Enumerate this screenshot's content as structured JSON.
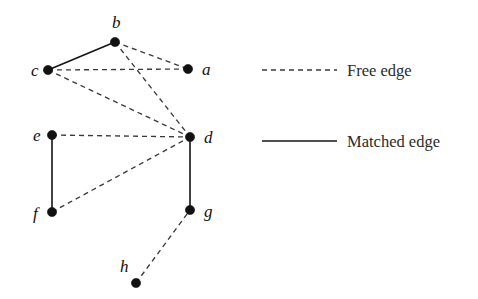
{
  "figure": {
    "type": "graph-diagram",
    "title": "",
    "background_color": "#ffffff",
    "width": 478,
    "height": 299
  },
  "graph": {
    "node_color": "#111111",
    "free_edge_color": "#3a3a3a",
    "matched_edge_color": "#141414",
    "nodes": [
      {
        "id": "b",
        "label": "b",
        "x": 115,
        "y": 42,
        "label_x": 112,
        "label_y": 28
      },
      {
        "id": "c",
        "label": "c",
        "x": 48,
        "y": 70,
        "label_x": 31,
        "label_y": 76
      },
      {
        "id": "a",
        "label": "a",
        "x": 188,
        "y": 69,
        "label_x": 202,
        "label_y": 75
      },
      {
        "id": "e",
        "label": "e",
        "x": 52,
        "y": 135,
        "label_x": 33,
        "label_y": 141
      },
      {
        "id": "d",
        "label": "d",
        "x": 190,
        "y": 137,
        "label_x": 204,
        "label_y": 143
      },
      {
        "id": "f",
        "label": "f",
        "x": 52,
        "y": 212,
        "label_x": 33,
        "label_y": 219
      },
      {
        "id": "g",
        "label": "g",
        "x": 190,
        "y": 210,
        "label_x": 204,
        "label_y": 217
      },
      {
        "id": "h",
        "label": "h",
        "x": 136,
        "y": 283,
        "label_x": 120,
        "label_y": 272
      }
    ],
    "edges": [
      {
        "from": "c",
        "to": "b",
        "kind": "matched"
      },
      {
        "from": "e",
        "to": "f",
        "kind": "matched"
      },
      {
        "from": "d",
        "to": "g",
        "kind": "matched"
      },
      {
        "from": "c",
        "to": "a",
        "kind": "free"
      },
      {
        "from": "b",
        "to": "a",
        "kind": "free"
      },
      {
        "from": "b",
        "to": "d",
        "kind": "free"
      },
      {
        "from": "c",
        "to": "d",
        "kind": "free"
      },
      {
        "from": "e",
        "to": "d",
        "kind": "free"
      },
      {
        "from": "f",
        "to": "d",
        "kind": "free"
      },
      {
        "from": "h",
        "to": "g",
        "kind": "free"
      }
    ]
  },
  "legend": {
    "items": [
      {
        "id": "free-edge",
        "label": "Free edge",
        "style": "dashed",
        "line_x1": 262,
        "line_x2": 337,
        "line_y": 70,
        "text_x": 347,
        "text_y": 76
      },
      {
        "id": "matched-edge",
        "label": "Matched edge",
        "style": "solid",
        "line_x1": 262,
        "line_x2": 337,
        "line_y": 141,
        "text_x": 347,
        "text_y": 147
      }
    ]
  }
}
